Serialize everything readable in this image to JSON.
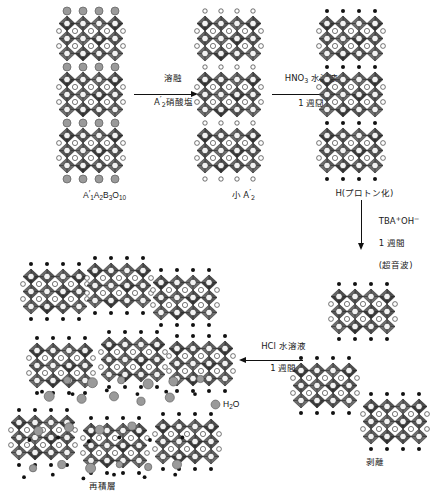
{
  "figure": {
    "background": "#ffffff"
  },
  "palette": {
    "octahedron_dark": "#3a3a3a",
    "octahedron_mid": "#555555",
    "octahedron_light": "#6e6e6e",
    "vertex_white": "#ffffff",
    "a_site_white": "#f2f2f2",
    "interlayer_gray": "#9a9a9a",
    "interlayer_small_white": "#ffffff",
    "proton_black": "#111111",
    "water_gray": "#9a9a9a",
    "stroke": "#111111",
    "text": "#1a1a1a"
  },
  "labels": {
    "parent_phase": "A'₁1A₁2B₁3O₁10",
    "parent_phase_parts": {
      "a_prime": "A'",
      "a_prime_sub": "1",
      "a": "A",
      "a_sub": "2",
      "b": "B",
      "b_sub": "3",
      "o": "O",
      "o_sub": "10"
    },
    "small_a_prime": "小 A'₁2",
    "small_a_prime_parts": {
      "prefix": "小",
      "symbol": "A'",
      "sub": "2"
    },
    "protonated": "H(プロトン化)",
    "exfoliated": "剥離",
    "restacked": "再積層",
    "water": "H₂2O",
    "water_parts": {
      "h": "H",
      "sub": "2",
      "o": "O"
    }
  },
  "arrows": [
    {
      "id": "arrow-molten-salt",
      "direction": "right",
      "lines": [
        "溶融",
        "A'₁2硝酸塩"
      ],
      "line1": "溶融",
      "line2_symbol": "A'",
      "line2_sub": "2",
      "line2_rest": "硝酸塩"
    },
    {
      "id": "arrow-hno3",
      "direction": "right",
      "lines": [
        "HNO₂3 水溶液",
        "1 週間"
      ],
      "line1_head": "HNO",
      "line1_sub": "3",
      "line1_rest": " 水溶液",
      "line2": "1 週間"
    },
    {
      "id": "arrow-tba-oh",
      "direction": "down",
      "lines": [
        "TBA⁺OH⁻",
        "1 週間",
        "(超音波)"
      ],
      "line1_a": "TBA",
      "line1_sup1": "+",
      "line1_b": "OH",
      "line1_sup2": "−",
      "line2": "1 週間",
      "line3": "(超音波)"
    },
    {
      "id": "arrow-hcl",
      "direction": "left",
      "lines": [
        "HCl 水溶液",
        "1 週間"
      ],
      "line1": "HCl 水溶液",
      "line2": "1 週間"
    }
  ],
  "structures": {
    "parent_column": {
      "name": "A'1A2B3O10 bulk layered perovskite",
      "blocks": 3,
      "layers_per_block": 3,
      "interlayer_species": "large-gray-sphere",
      "interlayer_species_label": "A'"
    },
    "small_a_column": {
      "name": "small A'2 exchanged layered perovskite",
      "blocks": 3,
      "layers_per_block": 3,
      "interlayer_species": "small-white-circle"
    },
    "protonated_column": {
      "name": "H protonated layered perovskite",
      "blocks": 3,
      "layers_per_block": 3,
      "interlayer_species": "small-black-dot"
    },
    "exfoliated_sheets": {
      "name": "exfoliated single nanosheets",
      "count": 3,
      "layers_per_sheet": 3,
      "surface_species": "small-black-dot"
    },
    "restacked_sheets": {
      "name": "restacked nanosheets with interlayer water",
      "count": 9,
      "layers_per_sheet": 3,
      "surface_species": "small-black-dot",
      "interlayer_species": "water-gray-sphere"
    }
  },
  "legend": [
    {
      "marker": "water-gray-sphere",
      "color": "#9a9a9a",
      "label": "H₂2O"
    }
  ]
}
